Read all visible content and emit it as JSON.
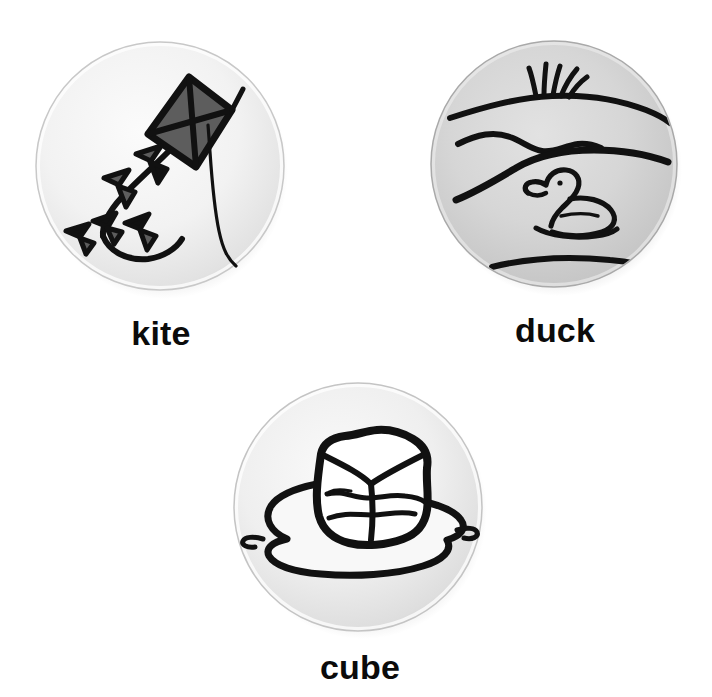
{
  "page": {
    "kind": "picture-word-cards",
    "background_color": "#ffffff",
    "card_count": 3
  },
  "cards": [
    {
      "id": "kite",
      "label": "kite",
      "illustration": "kite-flying-with-bow-tail",
      "disc_fill_center": "#f7f7f7",
      "disc_fill_edge": "#d9d9d9",
      "ink_color": "#111111",
      "accent_fill": "#5a5a5a",
      "description": "A diamond kite with crossed spars and a long string, trailing a tail of five bow ties"
    },
    {
      "id": "duck",
      "label": "duck",
      "illustration": "duck-swimming-on-pond",
      "disc_fill_center": "#d4d4d4",
      "disc_fill_edge": "#b8b8b8",
      "ink_color": "#111111",
      "accent_fill": "#c9c9c9",
      "description": "A duck floating on water, with a grassy far bank, shoreline and ripple lines"
    },
    {
      "id": "cube",
      "label": "cube",
      "illustration": "ice-cube-melting-in-puddle",
      "disc_fill_center": "#f2f2f2",
      "disc_fill_edge": "#d6d6d6",
      "ink_color": "#111111",
      "accent_fill": "#ffffff",
      "description": "A melting ice cube sitting in a spreading puddle of water"
    }
  ]
}
